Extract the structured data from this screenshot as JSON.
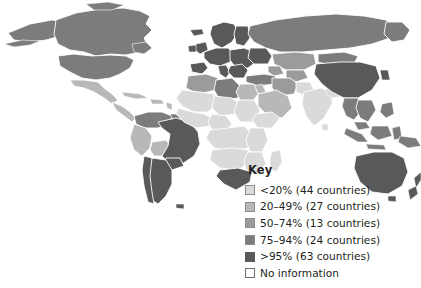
{
  "figure": {
    "type": "world-choropleth-map",
    "background_color": "#ffffff",
    "top_cut_text": ""
  },
  "legend": {
    "title": "Key",
    "items": [
      {
        "swatch": "s0",
        "color": "#d9dad9",
        "label": "<20% (44 countries)",
        "range": "<20%",
        "countries": 44
      },
      {
        "swatch": "s1",
        "color": "#b7b8b7",
        "label": "20–49% (27 countries)",
        "range": "20–49%",
        "countries": 27
      },
      {
        "swatch": "s2",
        "color": "#9a9b9a",
        "label": "50–74% (13 countries)",
        "range": "50–74%",
        "countries": 13
      },
      {
        "swatch": "s3",
        "color": "#7b7c7b",
        "label": "75–94% (24 countries)",
        "range": "75–94%",
        "countries": 24
      },
      {
        "swatch": "s4",
        "color": "#58595b",
        "label": ">95% (63 countries)",
        "range": ">95%",
        "countries": 63
      },
      {
        "swatch": "sn",
        "color": "#ffffff",
        "label": "No information",
        "range": "no-data",
        "countries": null
      }
    ]
  },
  "map": {
    "regions": [
      {
        "name": "Canada",
        "class": "c3"
      },
      {
        "name": "United States",
        "class": "c3"
      },
      {
        "name": "Alaska",
        "class": "c3"
      },
      {
        "name": "Greenland",
        "class": "cn"
      },
      {
        "name": "Mexico",
        "class": "c1"
      },
      {
        "name": "Central America",
        "class": "c1"
      },
      {
        "name": "Caribbean",
        "class": "c1"
      },
      {
        "name": "Brazil",
        "class": "c4"
      },
      {
        "name": "Argentina",
        "class": "c4"
      },
      {
        "name": "Chile",
        "class": "c4"
      },
      {
        "name": "Peru",
        "class": "c1"
      },
      {
        "name": "Bolivia",
        "class": "c1"
      },
      {
        "name": "Colombia",
        "class": "c3"
      },
      {
        "name": "Venezuela",
        "class": "c3"
      },
      {
        "name": "Western Europe",
        "class": "c4"
      },
      {
        "name": "Scandinavia",
        "class": "c4"
      },
      {
        "name": "Eastern Europe",
        "class": "c4"
      },
      {
        "name": "Russia",
        "class": "c3"
      },
      {
        "name": "Turkey",
        "class": "c3"
      },
      {
        "name": "North Africa",
        "class": "c2"
      },
      {
        "name": "Libya",
        "class": "c3"
      },
      {
        "name": "Egypt",
        "class": "c1"
      },
      {
        "name": "Sahel",
        "class": "c0"
      },
      {
        "name": "West Africa",
        "class": "c0"
      },
      {
        "name": "Central Africa",
        "class": "c0"
      },
      {
        "name": "East Africa",
        "class": "c0"
      },
      {
        "name": "Southern Africa",
        "class": "c0"
      },
      {
        "name": "South Africa",
        "class": "c4"
      },
      {
        "name": "Madagascar",
        "class": "c0"
      },
      {
        "name": "Arabian Peninsula",
        "class": "c1"
      },
      {
        "name": "Iran",
        "class": "c2"
      },
      {
        "name": "Central Asia",
        "class": "c2"
      },
      {
        "name": "India",
        "class": "c0"
      },
      {
        "name": "Pakistan",
        "class": "c0"
      },
      {
        "name": "China",
        "class": "c4"
      },
      {
        "name": "Mongolia",
        "class": "c3"
      },
      {
        "name": "Southeast Asia",
        "class": "c3"
      },
      {
        "name": "Indonesia",
        "class": "c3"
      },
      {
        "name": "Japan",
        "class": "cn"
      },
      {
        "name": "Australia",
        "class": "c4"
      },
      {
        "name": "New Zealand",
        "class": "c4"
      }
    ]
  }
}
